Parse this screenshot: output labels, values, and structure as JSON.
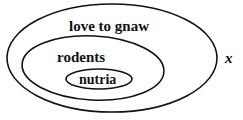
{
  "diagram": {
    "type": "nested-euler-diagram",
    "sets": [
      {
        "id": "outer",
        "label": "love to gnaw"
      },
      {
        "id": "middle",
        "label": "rodents"
      },
      {
        "id": "inner",
        "label": "nutria"
      }
    ],
    "relations": [
      {
        "subset": "nutria",
        "of": "rodents"
      },
      {
        "subset": "rodents",
        "of": "love to gnaw"
      }
    ],
    "external_label": "x",
    "colors": {
      "stroke": "#111111",
      "background": "#ffffff"
    }
  }
}
